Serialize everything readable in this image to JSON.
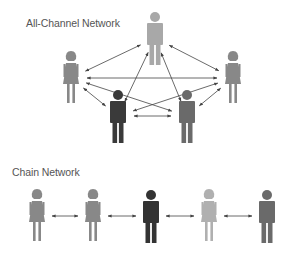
{
  "all_channel": {
    "title": "All-Channel Network",
    "nodes": [
      {
        "id": "top",
        "gender": "male",
        "color": "#a8a8a8",
        "x": 155,
        "y": 12
      },
      {
        "id": "left",
        "gender": "female",
        "color": "#888888",
        "x": 71,
        "y": 52
      },
      {
        "id": "right",
        "gender": "female",
        "color": "#888888",
        "x": 233,
        "y": 52
      },
      {
        "id": "bottom-left",
        "gender": "male",
        "color": "#3a3a3a",
        "x": 118,
        "y": 90
      },
      {
        "id": "bottom-right",
        "gender": "male",
        "color": "#6a6a6a",
        "x": 187,
        "y": 90
      }
    ],
    "edges": [
      [
        "top",
        "left"
      ],
      [
        "top",
        "right"
      ],
      [
        "top",
        "bottom-left"
      ],
      [
        "top",
        "bottom-right"
      ],
      [
        "left",
        "right"
      ],
      [
        "left",
        "bottom-left"
      ],
      [
        "left",
        "bottom-right"
      ],
      [
        "right",
        "bottom-left"
      ],
      [
        "right",
        "bottom-right"
      ],
      [
        "bottom-left",
        "bottom-right"
      ]
    ]
  },
  "chain": {
    "title": "Chain Network",
    "nodes": [
      {
        "id": "c1",
        "gender": "female",
        "color": "#888888",
        "x": 37,
        "y": 190
      },
      {
        "id": "c2",
        "gender": "female",
        "color": "#888888",
        "x": 93,
        "y": 190
      },
      {
        "id": "c3",
        "gender": "male",
        "color": "#333333",
        "x": 151,
        "y": 190
      },
      {
        "id": "c4",
        "gender": "female",
        "color": "#b0b0b0",
        "x": 209,
        "y": 190
      },
      {
        "id": "c5",
        "gender": "male",
        "color": "#6a6a6a",
        "x": 267,
        "y": 190
      }
    ],
    "edges": [
      [
        "c1",
        "c2"
      ],
      [
        "c2",
        "c3"
      ],
      [
        "c3",
        "c4"
      ],
      [
        "c4",
        "c5"
      ]
    ]
  },
  "colors": {
    "arrow": "#444444",
    "title_text": "#555555"
  }
}
